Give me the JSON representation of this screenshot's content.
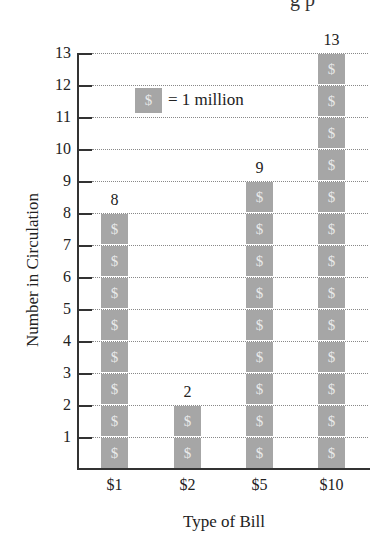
{
  "page": {
    "partial_heading_fragment": "g p"
  },
  "chart_data": {
    "type": "bar",
    "subtype": "pictograph",
    "title": "",
    "xlabel": "Type of Bill",
    "ylabel": "Number in Circulation",
    "categories": [
      "$1",
      "$2",
      "$5",
      "$10"
    ],
    "values": [
      8,
      2,
      9,
      13
    ],
    "data_labels": [
      "8",
      "2",
      "9",
      "13"
    ],
    "ylim": [
      0,
      13
    ],
    "yticks": [
      "1",
      "2",
      "3",
      "4",
      "5",
      "6",
      "7",
      "8",
      "9",
      "10",
      "11",
      "12",
      "13"
    ],
    "grid": "horizontal dotted",
    "legend": {
      "symbol": "$",
      "text": "= 1 million",
      "position": "top-left inside plot"
    },
    "unit_symbol": "$",
    "colors": {
      "bar_cell": "#a6a6a6",
      "symbol": "#e9e9e9",
      "axis": "#333333"
    }
  }
}
